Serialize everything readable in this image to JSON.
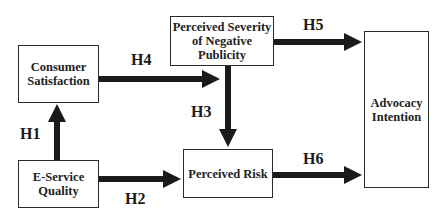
{
  "diagram": {
    "nodes": [
      {
        "id": "consumer_satisfaction",
        "label": "Consumer Satisfaction"
      },
      {
        "id": "perceived_severity",
        "label": "Perceived Severity of Negative Publicity"
      },
      {
        "id": "advocacy_intention",
        "label": "Advocacy Intention"
      },
      {
        "id": "e_service_quality",
        "label": "E-Service Quality"
      },
      {
        "id": "perceived_risk",
        "label": "Perceived Risk"
      }
    ],
    "edges": [
      {
        "from": "e_service_quality",
        "to": "consumer_satisfaction",
        "label": "H1"
      },
      {
        "from": "e_service_quality",
        "to": "perceived_risk",
        "label": "H2"
      },
      {
        "from": "perceived_severity",
        "to": "perceived_risk",
        "label": "H3"
      },
      {
        "from": "consumer_satisfaction",
        "to": "perceived_severity",
        "label": "H4"
      },
      {
        "from": "perceived_severity",
        "to": "advocacy_intention",
        "label": "H5"
      },
      {
        "from": "perceived_risk",
        "to": "advocacy_intention",
        "label": "H6"
      }
    ],
    "colors": {
      "arrow": "#1a1a1a",
      "border": "#2a2a2a",
      "background": "#ffffff"
    }
  }
}
